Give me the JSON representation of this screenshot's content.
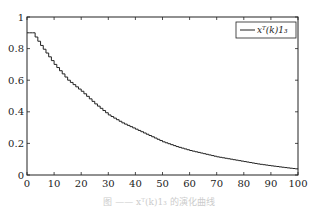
{
  "chart_data": {
    "type": "line",
    "title": "",
    "xlabel": "",
    "ylabel": "",
    "xlim": [
      0,
      100
    ],
    "ylim": [
      0,
      1
    ],
    "grid": false,
    "legend_position": "upper right",
    "x_ticks": [
      "0",
      "10",
      "20",
      "30",
      "40",
      "50",
      "60",
      "70",
      "80",
      "90",
      "100"
    ],
    "y_ticks": [
      "0",
      "0.2",
      "0.4",
      "0.6",
      "0.8",
      "1"
    ],
    "series": [
      {
        "name": "x^T(k)1_3",
        "style": "staircase",
        "x": [
          0,
          2,
          5,
          10,
          15,
          20,
          25,
          30,
          35,
          40,
          45,
          50,
          55,
          60,
          65,
          70,
          75,
          80,
          85,
          90,
          95,
          100
        ],
        "values": [
          0.9,
          0.9,
          0.82,
          0.7,
          0.6,
          0.53,
          0.45,
          0.38,
          0.33,
          0.29,
          0.25,
          0.21,
          0.18,
          0.155,
          0.135,
          0.115,
          0.1,
          0.085,
          0.07,
          0.058,
          0.047,
          0.037
        ]
      }
    ]
  },
  "legend": {
    "label": "xᵀ(k)1₃"
  },
  "caption": "图 —— xᵀ(k)1₃ 的演化曲线"
}
